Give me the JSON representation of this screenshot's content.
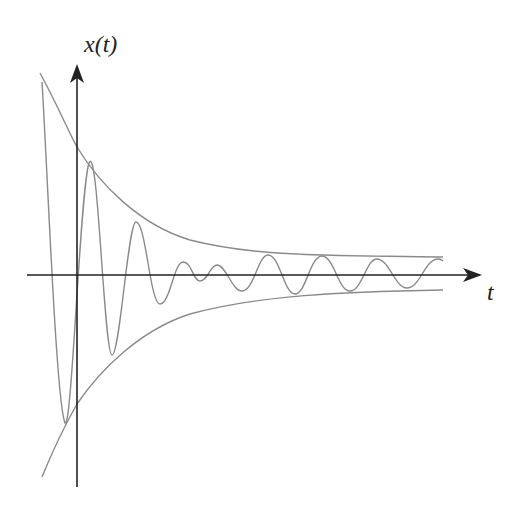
{
  "diagram": {
    "y_axis_label": "x(t)",
    "x_axis_label": "t",
    "colors": {
      "axis": "#222222",
      "curve": "#8a8a8a",
      "envelope": "#8a8a8a",
      "background": "#ffffff"
    },
    "elements": [
      {
        "name": "y-axis",
        "description": "vertical axis with arrow pointing up"
      },
      {
        "name": "x-axis",
        "description": "horizontal axis with arrow pointing right"
      },
      {
        "name": "upper-envelope",
        "description": "decaying curve from top-left approaching a positive asymptote"
      },
      {
        "name": "lower-envelope",
        "description": "mirror curve from bottom-left approaching a negative asymptote"
      },
      {
        "name": "oscillation",
        "description": "oscillating signal bounded by envelopes, large amplitude then settling into steady sinusoid"
      }
    ]
  }
}
